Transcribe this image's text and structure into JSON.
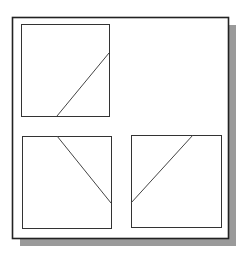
{
  "figure": {
    "colors": {
      "background": "#ffffff",
      "frame_stroke": "#222222",
      "panel_stroke": "#333333",
      "line_stroke": "#444444",
      "shadow": "#9a9a9a"
    },
    "frame": {
      "x": 12,
      "y": 17,
      "w": 216,
      "h": 221
    },
    "shadow": {
      "dx": 8,
      "dy": 8
    },
    "panels": [
      {
        "name": "top-left-view",
        "x": 21,
        "y": 24,
        "w": 88,
        "h": 92,
        "line": {
          "x1": 57,
          "y1": 116,
          "x2": 109,
          "y2": 53
        }
      },
      {
        "name": "bottom-left-view",
        "x": 22,
        "y": 136,
        "w": 89,
        "h": 92,
        "line": {
          "x1": 57,
          "y1": 136,
          "x2": 111,
          "y2": 203
        }
      },
      {
        "name": "bottom-right-view",
        "x": 131,
        "y": 135,
        "w": 90,
        "h": 92,
        "line": {
          "x1": 131,
          "y1": 203,
          "x2": 193,
          "y2": 135
        }
      }
    ]
  }
}
